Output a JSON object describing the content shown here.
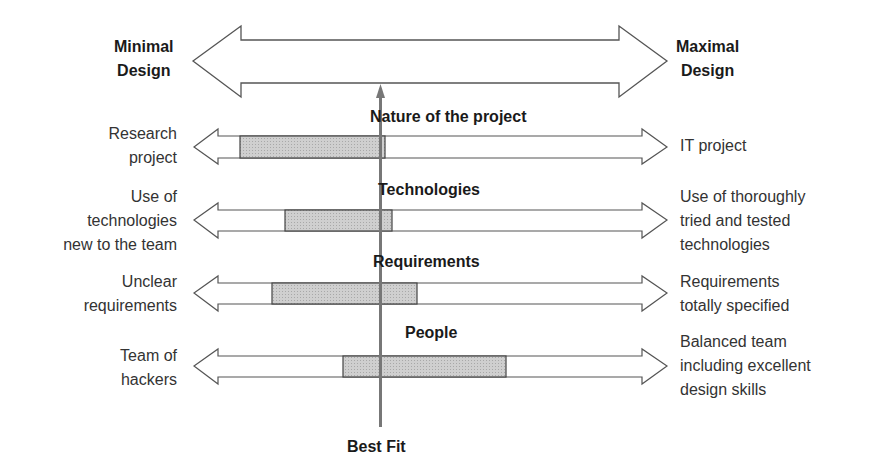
{
  "main_axis": {
    "left_label": [
      "Minimal",
      "Design"
    ],
    "right_label": [
      "Maximal",
      "Design"
    ]
  },
  "best_fit_label": "Best Fit",
  "factors": [
    {
      "title": "Nature of the project",
      "left": [
        "Research",
        "project"
      ],
      "right": [
        "IT project"
      ],
      "range": {
        "start_x": 240,
        "end_x": 385
      }
    },
    {
      "title": "Technologies",
      "left": [
        "Use of",
        "technologies",
        "new to the team"
      ],
      "right": [
        "Use of thoroughly",
        "tried and tested",
        "technologies"
      ],
      "range": {
        "start_x": 285,
        "end_x": 392
      }
    },
    {
      "title": "Requirements",
      "left": [
        "Unclear",
        "requirements"
      ],
      "right": [
        "Requirements",
        "totally specified"
      ],
      "range": {
        "start_x": 272,
        "end_x": 417
      }
    },
    {
      "title": "People",
      "left": [
        "Team of",
        "hackers"
      ],
      "right": [
        "Balanced team",
        "including excellent",
        "design skills"
      ],
      "range": {
        "start_x": 343,
        "end_x": 506
      }
    }
  ],
  "colors": {
    "stroke": "#444444",
    "range_fill": "#c8c8c8",
    "best_fit_line": "#777777"
  }
}
